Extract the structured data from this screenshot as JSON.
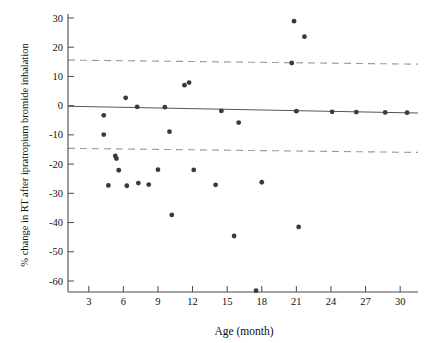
{
  "chart_data": {
    "type": "scatter",
    "title": "",
    "xlabel": "Age (month)",
    "ylabel": "% change in RT after ipratropium bromide inhalation",
    "xlim": [
      1.2,
      31.2
    ],
    "ylim": [
      -66,
      31
    ],
    "xticks": [
      3,
      6,
      9,
      12,
      15,
      18,
      21,
      24,
      27,
      30
    ],
    "yticks": [
      30,
      20,
      10,
      0,
      -10,
      -20,
      -30,
      -40,
      -50,
      -60
    ],
    "xtick_labels": [
      "3",
      "6",
      "9",
      "12",
      "15",
      "18",
      "21",
      "24",
      "27",
      "30"
    ],
    "ytick_labels": [
      "30",
      "20",
      "10",
      "0",
      "-10",
      "-20",
      "-30",
      "-40",
      "-50",
      "-60"
    ],
    "grid": false,
    "legend": "none",
    "series": [
      {
        "name": "Individual subjects",
        "marker": "filled-circle",
        "color": "#3a3a3a",
        "points": [
          {
            "x": 4.3,
            "y": -3.3
          },
          {
            "x": 4.3,
            "y": -9.9
          },
          {
            "x": 4.7,
            "y": -27.3
          },
          {
            "x": 5.3,
            "y": -17.2
          },
          {
            "x": 5.4,
            "y": -18.1
          },
          {
            "x": 5.6,
            "y": -22.1
          },
          {
            "x": 6.2,
            "y": 2.7
          },
          {
            "x": 6.3,
            "y": -27.4
          },
          {
            "x": 7.2,
            "y": -0.4
          },
          {
            "x": 7.3,
            "y": -26.5
          },
          {
            "x": 8.2,
            "y": -27.0
          },
          {
            "x": 9.0,
            "y": -21.9
          },
          {
            "x": 9.6,
            "y": -0.5
          },
          {
            "x": 10.0,
            "y": -8.9
          },
          {
            "x": 10.2,
            "y": -37.4
          },
          {
            "x": 11.3,
            "y": 7.0
          },
          {
            "x": 11.7,
            "y": 7.9
          },
          {
            "x": 12.1,
            "y": -22.0
          },
          {
            "x": 14.0,
            "y": -27.1
          },
          {
            "x": 14.5,
            "y": -1.8
          },
          {
            "x": 15.6,
            "y": -44.6
          },
          {
            "x": 16.0,
            "y": -5.8
          },
          {
            "x": 17.5,
            "y": -63.3
          },
          {
            "x": 18.0,
            "y": -26.2
          },
          {
            "x": 20.6,
            "y": 14.6
          },
          {
            "x": 20.8,
            "y": 28.9
          },
          {
            "x": 21.0,
            "y": -1.9
          },
          {
            "x": 21.2,
            "y": -41.5
          },
          {
            "x": 21.7,
            "y": 23.6
          },
          {
            "x": 24.1,
            "y": -2.1
          },
          {
            "x": 26.2,
            "y": -2.2
          },
          {
            "x": 28.7,
            "y": -2.3
          },
          {
            "x": 30.6,
            "y": -2.4
          }
        ]
      }
    ],
    "reference_lines": [
      {
        "name": "mean-line",
        "style": "solid",
        "color": "#555555",
        "y_start": -0.2,
        "y_end": -2.5
      },
      {
        "name": "upper-limit-of-agreement",
        "style": "dashed",
        "color": "#9a9a9a",
        "y_start": 15.6,
        "y_end": 14.2
      },
      {
        "name": "lower-limit-of-agreement",
        "style": "dashed",
        "color": "#9a9a9a",
        "y_start": -14.6,
        "y_end": -16.0
      }
    ]
  }
}
